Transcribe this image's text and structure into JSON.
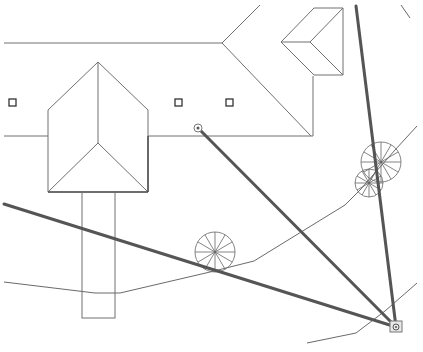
{
  "drawing": {
    "type": "site-plan",
    "colors": {
      "background": "#ffffff",
      "outline": "#707070",
      "sightline": "#555555",
      "path": "#6a6a6a"
    },
    "building": {
      "main_outline": [
        [
          4,
          43
        ],
        [
          222,
          43
        ],
        [
          260,
          5
        ]
      ],
      "main_ridge": [
        [
          222,
          43
        ],
        [
          311,
          136
        ]
      ],
      "main_bottom": [
        [
          148,
          136
        ],
        [
          313,
          136
        ]
      ],
      "left_eave": [
        [
          4,
          136
        ],
        [
          48,
          136
        ]
      ],
      "right_wall": [
        [
          313,
          76
        ],
        [
          313,
          136
        ]
      ],
      "dormer": {
        "box": [
          [
            314,
            8
          ],
          [
            343,
            8
          ],
          [
            343,
            75
          ],
          [
            314,
            75
          ]
        ],
        "left_point": [
          281,
          42
        ],
        "inner_point": [
          310,
          42
        ]
      },
      "wing": {
        "apex": [
          98,
          62
        ],
        "left_shoulder": [
          48,
          110
        ],
        "right_shoulder": [
          148,
          110
        ],
        "inner_point": [
          98,
          143
        ],
        "bottom_y": 192
      },
      "walkway": {
        "x": 82,
        "y": 192,
        "width": 33,
        "height": 126
      }
    },
    "vents": [
      [
        13,
        103
      ],
      [
        178,
        103
      ],
      [
        229,
        103
      ]
    ],
    "sightlines": [
      {
        "from": [
          4,
          204
        ],
        "to": [
          396,
          327
        ]
      },
      {
        "from": [
          198,
          128
        ],
        "to": [
          396,
          327
        ]
      },
      {
        "from": [
          356,
          6
        ],
        "to": [
          396,
          327
        ]
      }
    ],
    "paths": [
      [
        [
          4,
          282
        ],
        [
          95,
          293
        ],
        [
          120,
          293
        ],
        [
          210,
          272
        ],
        [
          254,
          261
        ],
        [
          345,
          205
        ],
        [
          360,
          190
        ],
        [
          395,
          150
        ],
        [
          417,
          126
        ]
      ],
      [
        [
          307,
          343
        ],
        [
          356,
          333
        ],
        [
          385,
          311
        ],
        [
          417,
          283
        ]
      ]
    ],
    "arc_fragment": [
      [
        401,
        5
      ],
      [
        410,
        18
      ]
    ],
    "trees": [
      {
        "cx": 215,
        "cy": 252,
        "r": 20
      },
      {
        "cx": 381,
        "cy": 162,
        "r": 20
      },
      {
        "cx": 369,
        "cy": 183,
        "r": 14
      }
    ],
    "markers": {
      "origin_point": [
        198,
        128
      ],
      "target_box": [
        396,
        327
      ]
    }
  }
}
